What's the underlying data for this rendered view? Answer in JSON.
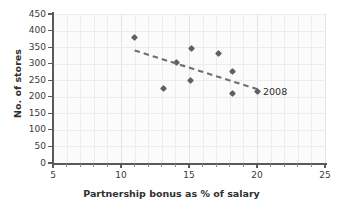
{
  "chart_data": {
    "type": "scatter",
    "title": "",
    "xlabel": "Partnership bonus as % of salary",
    "ylabel": "No. of stores",
    "xlim": [
      5,
      25
    ],
    "ylim": [
      0,
      450
    ],
    "x_ticks": [
      5,
      10,
      15,
      20,
      25
    ],
    "y_ticks": [
      0,
      50,
      100,
      150,
      200,
      250,
      300,
      350,
      400,
      450
    ],
    "x_tick_labels": [
      "5",
      "10",
      "15",
      "20",
      "25"
    ],
    "y_tick_labels": [
      "0",
      "50",
      "100",
      "150",
      "200",
      "250",
      "300",
      "350",
      "400",
      "450"
    ],
    "x_minor_step": 1,
    "grid": true,
    "legend": "none",
    "marker": "diamond",
    "marker_color": "#5c6068",
    "points": [
      {
        "x": 11.0,
        "y": 380,
        "label": ""
      },
      {
        "x": 13.1,
        "y": 225,
        "label": ""
      },
      {
        "x": 14.1,
        "y": 305,
        "label": ""
      },
      {
        "x": 15.2,
        "y": 345,
        "label": ""
      },
      {
        "x": 15.1,
        "y": 250,
        "label": ""
      },
      {
        "x": 17.2,
        "y": 330,
        "label": ""
      },
      {
        "x": 18.2,
        "y": 275,
        "label": ""
      },
      {
        "x": 18.2,
        "y": 210,
        "label": ""
      },
      {
        "x": 20.0,
        "y": 215,
        "label": "2008"
      }
    ],
    "annotations": [
      {
        "text": "2008",
        "x": 20.0,
        "y": 215
      }
    ],
    "trendline": {
      "style": "dashed",
      "color": "#6b6f77",
      "x_start": 11.0,
      "y_start": 340,
      "x_end": 20.1,
      "y_end": 222
    }
  },
  "axis_colors": {
    "axis": "#5a5a5a",
    "grid": "#ececec",
    "text": "#2f2f2f",
    "marker": "#5c6068",
    "trend": "#6b6f77"
  }
}
